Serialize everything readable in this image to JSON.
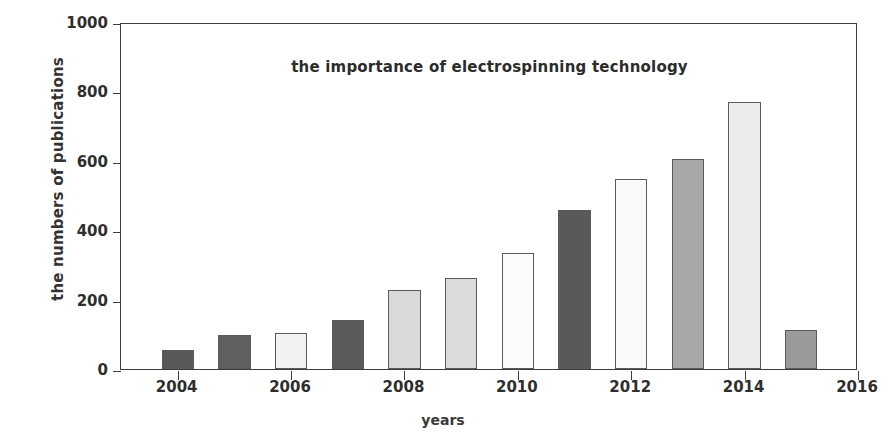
{
  "chart_data": {
    "type": "bar",
    "title": "the importance of electrospinning technology",
    "xlabel": "years",
    "ylabel": "the numbers of publications",
    "categories": [
      2004,
      2005,
      2006,
      2007,
      2008,
      2009,
      2010,
      2011,
      2012,
      2013,
      2014,
      2015
    ],
    "values": [
      55,
      97,
      103,
      140,
      228,
      262,
      333,
      458,
      547,
      605,
      770,
      113
    ],
    "bar_colors": [
      "#585858",
      "#606060",
      "#f2f2f2",
      "#5b5b5b",
      "#d9d9d9",
      "#dcdcdc",
      "#fbfbfb",
      "#595959",
      "#fafafa",
      "#a8a8a8",
      "#ececec",
      "#9a9a9a"
    ],
    "xlim": [
      2003,
      2016
    ],
    "ylim": [
      0,
      1000
    ],
    "xticks": [
      2004,
      2006,
      2008,
      2010,
      2012,
      2014,
      2016
    ],
    "xticklabels": [
      "2004",
      "2006",
      "2008",
      "2010",
      "2012",
      "2014",
      "2016"
    ],
    "yticks": [
      0,
      200,
      400,
      600,
      800,
      1000
    ],
    "yticklabels": [
      "0",
      "200",
      "400",
      "600",
      "800",
      "1000"
    ],
    "grid": false,
    "legend": null,
    "frame_color": "#3d3d3d",
    "background": "#ffffff"
  }
}
